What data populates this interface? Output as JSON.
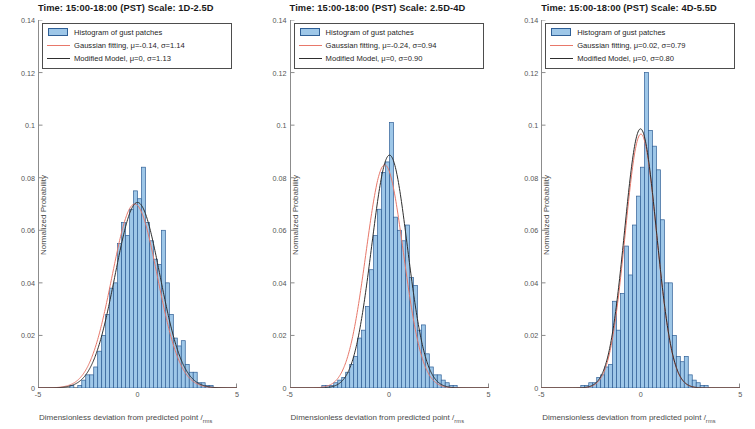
{
  "figure": {
    "xlabel": "Dimensionless deviation from predicted point",
    "xlabel_divider": "/",
    "xlabel_sub": "rms",
    "ylabel": "Normalized Probability",
    "colors": {
      "bar_fill": "#9ec7e8",
      "bar_edge": "#2f5f96",
      "gaussian": "#e8786a",
      "model": "#2e2e2e",
      "axis": "#8c8c8c"
    }
  },
  "panels": [
    {
      "title": "Time: 15:00-18:00 (PST)  Scale: 1D-2.5D",
      "legend": {
        "hist_label": "Histogram of gust patches",
        "gauss_label": "Gaussian fitting, μ=-0.14, σ=1.14",
        "model_label": "Modified Model, μ=0, σ=1.13"
      },
      "chart_data": {
        "type": "bar",
        "title": "Time: 15:00-18:00 (PST)  Scale: 1D-2.5D",
        "xlabel": "Dimensionless deviation from predicted point /rms",
        "ylabel": "Normalized Probability",
        "xlim": [
          -5,
          5
        ],
        "ylim": [
          0,
          0.14
        ],
        "xticks": [
          -5,
          0,
          5
        ],
        "yticks": [
          0,
          0.02,
          0.04,
          0.06,
          0.08,
          0.1,
          0.12,
          0.14
        ],
        "grid": false,
        "legend_position": "top-left",
        "bin_width": 0.2,
        "bin_centers": [
          -4.5,
          -4.3,
          -4.1,
          -3.9,
          -3.7,
          -3.5,
          -3.3,
          -3.1,
          -2.9,
          -2.7,
          -2.5,
          -2.3,
          -2.1,
          -1.9,
          -1.7,
          -1.5,
          -1.3,
          -1.1,
          -0.9,
          -0.7,
          -0.5,
          -0.3,
          -0.1,
          0.1,
          0.3,
          0.5,
          0.7,
          0.9,
          1.1,
          1.3,
          1.5,
          1.7,
          1.9,
          2.1,
          2.3,
          2.5,
          2.7,
          2.9,
          3.1,
          3.3,
          3.5,
          3.7,
          3.9,
          4.1,
          4.3,
          4.5
        ],
        "values": [
          0.0,
          0.0,
          0.0,
          0.0,
          0.0,
          0.0,
          0.001,
          0.0,
          0.001,
          0.003,
          0.005,
          0.005,
          0.008,
          0.014,
          0.02,
          0.028,
          0.038,
          0.04,
          0.055,
          0.063,
          0.058,
          0.068,
          0.075,
          0.072,
          0.084,
          0.063,
          0.056,
          0.049,
          0.047,
          0.06,
          0.04,
          0.028,
          0.019,
          0.016,
          0.018,
          0.009,
          0.006,
          0.006,
          0.002,
          0.002,
          0.001,
          0.001,
          0.0,
          0.0,
          0.0,
          0.0
        ],
        "series": [
          {
            "name": "Gaussian fitting",
            "mu": -0.14,
            "sigma": 1.14,
            "peak": 0.07,
            "color": "#e8786a"
          },
          {
            "name": "Modified Model",
            "mu": 0.0,
            "sigma": 1.13,
            "peak": 0.0706,
            "color": "#2e2e2e"
          }
        ]
      }
    },
    {
      "title": "Time: 15:00-18:00 (PST)   Scale: 2.5D-4D",
      "legend": {
        "hist_label": "Histogram of gust patches",
        "gauss_label": "Gaussian fitting, μ=-0.24, σ=0.94",
        "model_label": "Modified Model, μ=0, σ=0.90"
      },
      "chart_data": {
        "type": "bar",
        "title": "Time: 15:00-18:00 (PST)   Scale: 2.5D-4D",
        "xlabel": "Dimensionless deviation from predicted point /rms",
        "ylabel": "Normalized Probability",
        "xlim": [
          -5,
          5
        ],
        "ylim": [
          0,
          0.14
        ],
        "xticks": [
          -5,
          0,
          5
        ],
        "yticks": [
          0,
          0.02,
          0.04,
          0.06,
          0.08,
          0.1,
          0.12,
          0.14
        ],
        "grid": false,
        "legend_position": "top-left",
        "bin_width": 0.2,
        "bin_centers": [
          -4.5,
          -4.3,
          -4.1,
          -3.9,
          -3.7,
          -3.5,
          -3.3,
          -3.1,
          -2.9,
          -2.7,
          -2.5,
          -2.3,
          -2.1,
          -1.9,
          -1.7,
          -1.5,
          -1.3,
          -1.1,
          -0.9,
          -0.7,
          -0.5,
          -0.3,
          -0.1,
          0.1,
          0.3,
          0.5,
          0.7,
          0.9,
          1.1,
          1.3,
          1.5,
          1.7,
          1.9,
          2.1,
          2.3,
          2.5,
          2.7,
          2.9,
          3.1,
          3.3,
          3.5,
          3.7,
          3.9,
          4.1,
          4.3,
          4.5
        ],
        "values": [
          0.0,
          0.0,
          0.0,
          0.0,
          0.0,
          0.0,
          0.001,
          0.001,
          0.001,
          0.002,
          0.003,
          0.004,
          0.006,
          0.009,
          0.012,
          0.019,
          0.022,
          0.031,
          0.045,
          0.058,
          0.068,
          0.082,
          0.086,
          0.101,
          0.065,
          0.06,
          0.056,
          0.062,
          0.042,
          0.039,
          0.022,
          0.024,
          0.013,
          0.008,
          0.005,
          0.005,
          0.003,
          0.002,
          0.001,
          0.001,
          0.0,
          0.0,
          0.0,
          0.0,
          0.0,
          0.0
        ],
        "series": [
          {
            "name": "Gaussian fitting",
            "mu": -0.24,
            "sigma": 0.94,
            "peak": 0.0849,
            "color": "#e8786a"
          },
          {
            "name": "Modified Model",
            "mu": 0.0,
            "sigma": 0.9,
            "peak": 0.0886,
            "color": "#2e2e2e"
          }
        ]
      }
    },
    {
      "title": "Time: 15:00-18:00 (PST)   Scale: 4D-5.5D",
      "legend": {
        "hist_label": "Histogram of gust patches",
        "gauss_label": "Gaussian fitting, μ=0.02, σ=0.79",
        "model_label": "Modified Model, μ=0, σ=0.80"
      },
      "chart_data": {
        "type": "bar",
        "title": "Time: 15:00-18:00 (PST)   Scale: 4D-5.5D",
        "xlabel": "Dimensionless deviation from predicted point /rms",
        "ylabel": "Normalized Probability",
        "xlim": [
          -5,
          5
        ],
        "ylim": [
          0,
          0.14
        ],
        "xticks": [
          -5,
          0,
          5
        ],
        "yticks": [
          0,
          0.02,
          0.04,
          0.06,
          0.08,
          0.1,
          0.12,
          0.14
        ],
        "grid": false,
        "legend_position": "top-left",
        "bin_width": 0.2,
        "bin_centers": [
          -4.5,
          -4.3,
          -4.1,
          -3.9,
          -3.7,
          -3.5,
          -3.3,
          -3.1,
          -2.9,
          -2.7,
          -2.5,
          -2.3,
          -2.1,
          -1.9,
          -1.7,
          -1.5,
          -1.3,
          -1.1,
          -0.9,
          -0.7,
          -0.5,
          -0.3,
          -0.1,
          0.1,
          0.3,
          0.5,
          0.7,
          0.9,
          1.1,
          1.3,
          1.5,
          1.7,
          1.9,
          2.1,
          2.3,
          2.5,
          2.7,
          2.9,
          3.1,
          3.3,
          3.5,
          3.7,
          3.9,
          4.1,
          4.3,
          4.5
        ],
        "values": [
          0.0,
          0.0,
          0.0,
          0.0,
          0.0,
          0.0,
          0.0,
          0.0,
          0.001,
          0.001,
          0.002,
          0.002,
          0.004,
          0.005,
          0.008,
          0.009,
          0.033,
          0.022,
          0.036,
          0.054,
          0.043,
          0.062,
          0.073,
          0.084,
          0.12,
          0.098,
          0.092,
          0.083,
          0.064,
          0.04,
          0.04,
          0.02,
          0.012,
          0.01,
          0.012,
          0.005,
          0.003,
          0.002,
          0.001,
          0.001,
          0.0,
          0.0,
          0.0,
          0.0,
          0.0,
          0.0
        ],
        "series": [
          {
            "name": "Gaussian fitting",
            "mu": 0.02,
            "sigma": 0.79,
            "peak": 0.0966,
            "color": "#e8786a"
          },
          {
            "name": "Modified Model",
            "mu": 0.0,
            "sigma": 0.8,
            "peak": 0.0986,
            "color": "#2e2e2e"
          }
        ]
      }
    }
  ]
}
